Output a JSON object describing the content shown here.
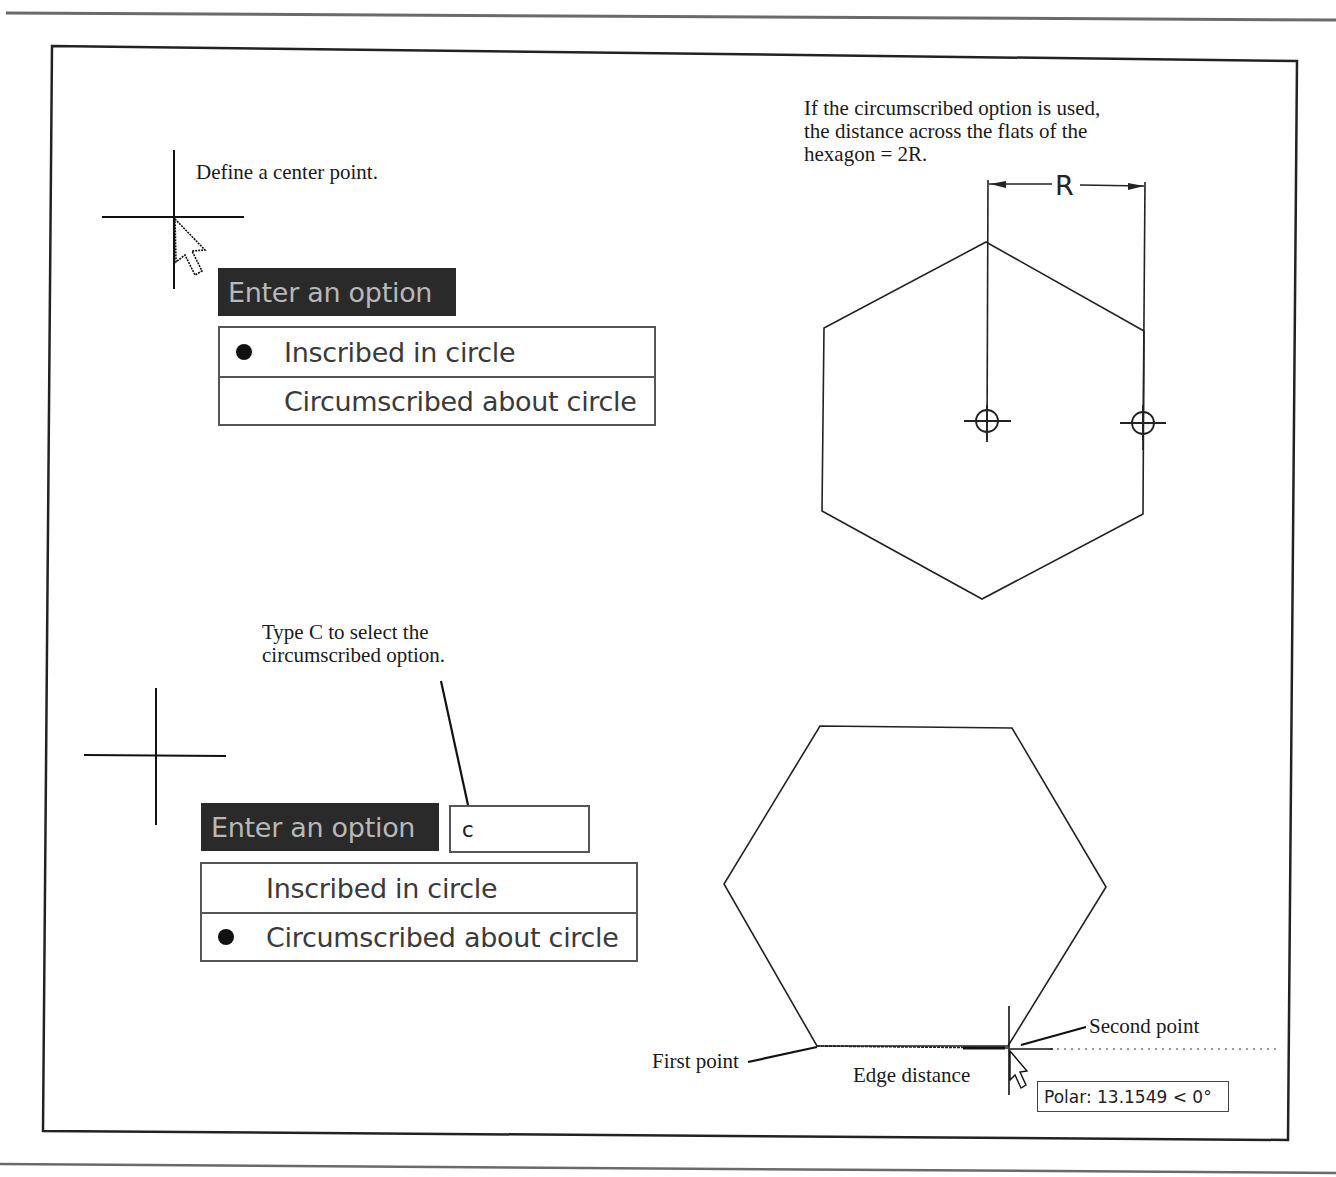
{
  "upper_left": {
    "step_caption": "Define a center point.",
    "prompt_label": "Enter an option",
    "options": [
      {
        "label": "Inscribed in circle",
        "selected": true
      },
      {
        "label": "Circumscribed about circle",
        "selected": false
      }
    ],
    "icons": [
      "crosshair-cursor-icon",
      "arrow-pointer-icon",
      "radio-bullet-icon"
    ]
  },
  "upper_right": {
    "note_lines": [
      "If the circumscribed option is used,",
      "the distance across the flats of the",
      "hexagon = 2R."
    ],
    "dimension_label": "R",
    "icons": [
      "center-snap-marker-icon",
      "center-snap-marker-icon"
    ]
  },
  "lower_left": {
    "callout_lines": [
      "Type C to select the",
      "circumscribed option."
    ],
    "prompt_label": "Enter an option",
    "command_input_value": "c",
    "options": [
      {
        "label": "Inscribed in circle",
        "selected": false
      },
      {
        "label": "Circumscribed about circle",
        "selected": true
      }
    ],
    "icons": [
      "crosshair-cursor-icon",
      "radio-bullet-icon"
    ]
  },
  "lower_right": {
    "first_point_label": "First point",
    "second_point_label": "Second point",
    "edge_distance_label": "Edge distance",
    "polar_tooltip": "Polar: 13.1549 < 0°",
    "icons": [
      "crosshair-cursor-icon",
      "arrow-pointer-icon"
    ]
  },
  "colors": {
    "line": "#1a1a1a",
    "prompt_bg": "#2a2a2a",
    "prompt_text": "#b8b8b8",
    "option_text": "#3a3a3a",
    "border": "#555555"
  }
}
